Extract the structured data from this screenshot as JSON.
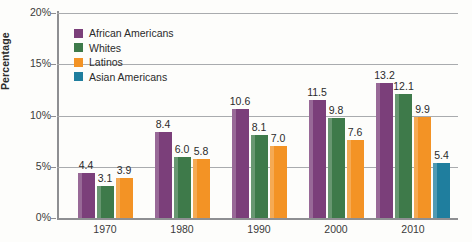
{
  "chart_data": {
    "type": "bar",
    "title": "",
    "xlabel": "",
    "ylabel": "Percentage",
    "ylim": [
      0,
      20
    ],
    "grid": true,
    "legend_position": "top-left",
    "categories": [
      "1970",
      "1980",
      "1990",
      "2000",
      "2010"
    ],
    "ytick_labels": [
      "0%",
      "5%",
      "10%",
      "15%",
      "20%"
    ],
    "ytick_values": [
      0,
      5,
      10,
      15,
      20
    ],
    "series": [
      {
        "name": "African Americans",
        "color": "#7B3F7A",
        "values": [
          4.4,
          8.4,
          10.6,
          11.5,
          13.2
        ],
        "labels": [
          "4.4",
          "8.4",
          "10.6",
          "11.5",
          "13.2"
        ]
      },
      {
        "name": "Whites",
        "color": "#3E7A4A",
        "values": [
          3.1,
          6.0,
          8.1,
          9.8,
          12.1
        ],
        "labels": [
          "3.1",
          "6.0",
          "8.1",
          "9.8",
          "12.1"
        ]
      },
      {
        "name": "Latinos",
        "color": "#F39325",
        "values": [
          3.9,
          5.8,
          7.0,
          7.6,
          9.9
        ],
        "labels": [
          "3.9",
          "5.8",
          "7.0",
          "7.6",
          "9.9"
        ]
      },
      {
        "name": "Asian Americans",
        "color": "#1F7E9E",
        "values": [
          null,
          null,
          null,
          null,
          5.4
        ],
        "labels": [
          "",
          "",
          "",
          "",
          "5.4"
        ]
      }
    ]
  }
}
